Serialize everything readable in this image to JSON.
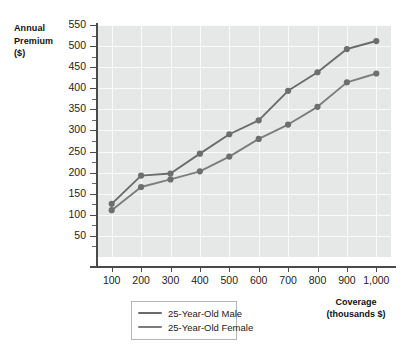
{
  "chart_data": {
    "type": "line",
    "title": "",
    "ylabel": "Annual Premium ($)",
    "xlabel": "Coverage (thousands $)",
    "x": [
      100,
      200,
      300,
      400,
      500,
      600,
      700,
      800,
      900,
      1000
    ],
    "xticklabels": [
      "100",
      "200",
      "300",
      "400",
      "500",
      "600",
      "700",
      "800",
      "900",
      "1,000"
    ],
    "yticklabels": [
      "50",
      "100",
      "150",
      "200",
      "250",
      "300",
      "350",
      "400",
      "450",
      "500",
      "550"
    ],
    "yticks": [
      50,
      100,
      150,
      200,
      250,
      300,
      350,
      400,
      450,
      500,
      550
    ],
    "xlim": [
      50,
      1050
    ],
    "ylim": [
      0,
      550
    ],
    "grid": true,
    "legend_position": "bottom-left",
    "series": [
      {
        "name": "25-Year-Old Male",
        "color": "#6b6b6b",
        "values": [
          126,
          193,
          198,
          245,
          291,
          324,
          394,
          438,
          493,
          512
        ]
      },
      {
        "name": "25-Year-Old Female",
        "color": "#7d7d7d",
        "values": [
          111,
          166,
          184,
          203,
          238,
          280,
          314,
          356,
          414,
          435
        ]
      }
    ]
  },
  "axes": {
    "y_title_lines": [
      "Annual",
      "Premium",
      "($)"
    ],
    "x_title_lines": [
      "Coverage",
      "(thousands $)"
    ]
  },
  "style": {
    "plot_background": "#e6e8e8",
    "grid_color": "#fafafa",
    "axis_color": "#4a4a4a",
    "marker_color": "#6e6e6e",
    "legend_border": "#b6b6b6"
  }
}
